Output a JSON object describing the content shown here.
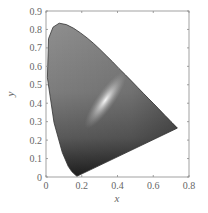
{
  "chart_data": {
    "type": "area",
    "title": "",
    "subtitle": "CIE 1931 chromaticity diagram (grayscale rendering)",
    "xlabel": "x",
    "ylabel": "y",
    "xlim": [
      0,
      0.8
    ],
    "ylim": [
      0,
      0.9
    ],
    "x_ticks": [
      "0",
      "0.2",
      "0.4",
      "0.6",
      "0.8"
    ],
    "y_ticks": [
      "0",
      "0.1",
      "0.2",
      "0.3",
      "0.4",
      "0.5",
      "0.6",
      "0.7",
      "0.8",
      "0.9"
    ],
    "grid": false,
    "legend": null,
    "series": [
      {
        "name": "spectral locus",
        "x": [
          0.175,
          0.172,
          0.166,
          0.144,
          0.124,
          0.091,
          0.045,
          0.008,
          0.014,
          0.039,
          0.074,
          0.114,
          0.155,
          0.193,
          0.23,
          0.267,
          0.302,
          0.337,
          0.373,
          0.408,
          0.444,
          0.479,
          0.512,
          0.545,
          0.575,
          0.603,
          0.627,
          0.648,
          0.666,
          0.68,
          0.691,
          0.699,
          0.705,
          0.735
        ],
        "y": [
          0.005,
          0.005,
          0.009,
          0.03,
          0.058,
          0.133,
          0.295,
          0.538,
          0.75,
          0.812,
          0.834,
          0.826,
          0.806,
          0.781,
          0.754,
          0.724,
          0.692,
          0.659,
          0.624,
          0.589,
          0.554,
          0.52,
          0.487,
          0.454,
          0.424,
          0.397,
          0.373,
          0.352,
          0.334,
          0.32,
          0.309,
          0.301,
          0.295,
          0.265
        ]
      },
      {
        "name": "purple line",
        "x": [
          0.735,
          0.175
        ],
        "y": [
          0.265,
          0.005
        ]
      }
    ],
    "annotations": [
      {
        "label": "white point (brightest region)",
        "x": 0.31,
        "y": 0.33
      }
    ]
  },
  "axes": {
    "xlabel": "x",
    "ylabel": "y"
  },
  "colors": {
    "axis": "#888888",
    "fill_dark": "#2a2a2a",
    "fill_mid": "#7a7a7a",
    "fill_light": "#9a9a9a",
    "highlight": "#f4f4f4"
  }
}
